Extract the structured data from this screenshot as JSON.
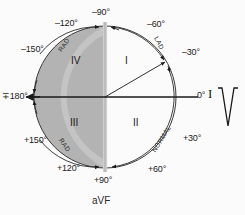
{
  "figure": {
    "name": "hexaxial-reference-circle",
    "background_color": "#fbfbfb",
    "shaded_region_color": "#b3b3b3",
    "circle_stroke_color": "#3a3a3a",
    "axis_line_color": "#1a1a1a",
    "avf_bar_color": "#c9c9c9"
  },
  "angle_labels": [
    {
      "name": "angle-minus-90",
      "text": "–90°"
    },
    {
      "name": "angle-minus-120",
      "text": "–120°"
    },
    {
      "name": "angle-minus-150",
      "text": "–150°"
    },
    {
      "name": "angle-plus-minus-180",
      "text": "∓180°"
    },
    {
      "name": "angle-plus-150",
      "text": "+150°"
    },
    {
      "name": "angle-plus-120",
      "text": "+120°"
    },
    {
      "name": "angle-plus-90",
      "text": "+90°"
    },
    {
      "name": "angle-plus-60",
      "text": "+60°"
    },
    {
      "name": "angle-plus-30",
      "text": "+30°"
    },
    {
      "name": "angle-zero",
      "text": "0°"
    },
    {
      "name": "angle-minus-30",
      "text": "–30°"
    },
    {
      "name": "angle-minus-60",
      "text": "–60°"
    }
  ],
  "quadrants": [
    {
      "name": "quadrant-one",
      "text": "I"
    },
    {
      "name": "quadrant-two",
      "text": "II"
    },
    {
      "name": "quadrant-three",
      "text": "III"
    },
    {
      "name": "quadrant-four",
      "text": "IV"
    }
  ],
  "arc_labels": [
    {
      "name": "arc-label-rad-upper",
      "text": "RAD"
    },
    {
      "name": "arc-label-rad-lower",
      "text": "RAD"
    },
    {
      "name": "arc-label-lad",
      "text": "LAD"
    },
    {
      "name": "arc-label-normal",
      "text": "NORMAL"
    }
  ],
  "axes": {
    "vertical_axis_label": "aVF",
    "horizontal_lead_label": "I",
    "zero_degree_label": "0°"
  },
  "ecg": {
    "name": "qrs-complex-waveform",
    "description": "Negative QRS deflection"
  }
}
